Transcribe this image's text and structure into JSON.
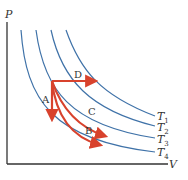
{
  "diagram": {
    "type": "PV diagram with isotherms",
    "axes": {
      "y_label": "P",
      "x_label": "V"
    },
    "isotherms": [
      {
        "label_base": "T",
        "label_sub": "1"
      },
      {
        "label_base": "T",
        "label_sub": "2"
      },
      {
        "label_base": "T",
        "label_sub": "3"
      },
      {
        "label_base": "T",
        "label_sub": "4"
      }
    ],
    "processes": [
      {
        "label": "A",
        "description": "vertical decrease in pressure at constant volume"
      },
      {
        "label": "B",
        "description": "curved path to lowest isotherm"
      },
      {
        "label": "C",
        "description": "curved path to third isotherm"
      },
      {
        "label": "D",
        "description": "horizontal increase in volume at constant pressure"
      }
    ],
    "colors": {
      "isotherm": "#3f72a8",
      "process": "#d8422d",
      "axis": "#333333"
    }
  }
}
